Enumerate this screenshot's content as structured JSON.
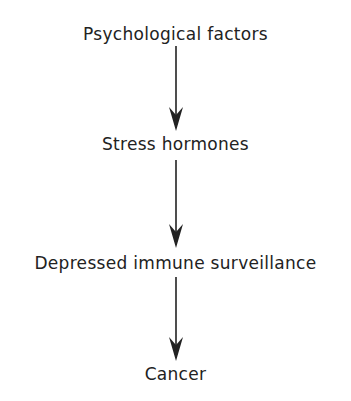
{
  "diagram": {
    "type": "flowchart",
    "direction": "top-to-bottom",
    "nodes": [
      {
        "id": "n1",
        "label": "Psychological factors"
      },
      {
        "id": "n2",
        "label": "Stress hormones"
      },
      {
        "id": "n3",
        "label": "Depressed immune surveillance"
      },
      {
        "id": "n4",
        "label": "Cancer"
      }
    ],
    "edges": [
      {
        "from": "n1",
        "to": "n2"
      },
      {
        "from": "n2",
        "to": "n3"
      },
      {
        "from": "n3",
        "to": "n4"
      }
    ],
    "colors": {
      "background": "#ffffff",
      "ink": "#222222"
    }
  }
}
